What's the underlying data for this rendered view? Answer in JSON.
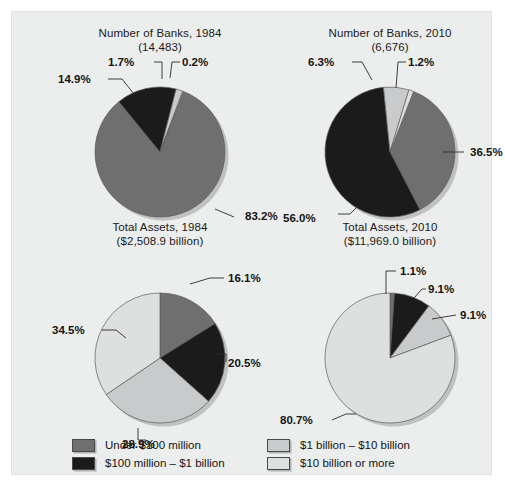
{
  "figure": {
    "background_color": "#eceded",
    "page_background": "#ffffff"
  },
  "palette": {
    "under_100m": "#6f6f6f",
    "100m_1b": "#1b1b1b",
    "1b_10b": "#c9cacb",
    "10b_or_more": "#dedfdf",
    "slice_outline": "#5d5d5d",
    "text": "#141414"
  },
  "legend": {
    "entries": [
      {
        "label": "Under $100 million",
        "color": "#6f6f6f"
      },
      {
        "label": "$100 million – $1 billion",
        "color": "#1b1b1b"
      },
      {
        "label": "$1 billion – $10 billion",
        "color": "#c9cacb"
      },
      {
        "label": "$10 billion or more",
        "color": "#dedfdf"
      }
    ]
  },
  "chart_data": [
    {
      "type": "pie",
      "id": "number-of-banks-1984",
      "title": "Number of Banks, 1984",
      "subtitle": "(14,483)",
      "categories": [
        "Under $100 million",
        "$100 million – $1 billion",
        "$1 billion – $10 billion",
        "$10 billion or more"
      ],
      "values": [
        83.2,
        14.9,
        1.7,
        0.2
      ],
      "labels": [
        "83.2%",
        "14.9%",
        "1.7%",
        "0.2%"
      ],
      "colors": [
        "#6f6f6f",
        "#1b1b1b",
        "#c9cacb",
        "#dedfdf"
      ],
      "units": "percent"
    },
    {
      "type": "pie",
      "id": "number-of-banks-2010",
      "title": "Number of Banks, 2010",
      "subtitle": "(6,676)",
      "categories": [
        "Under $100 million",
        "$100 million – $1 billion",
        "$1 billion – $10 billion",
        "$10 billion or more"
      ],
      "values": [
        36.5,
        56.0,
        6.3,
        1.2
      ],
      "labels": [
        "36.5%",
        "56.0%",
        "6.3%",
        "1.2%"
      ],
      "colors": [
        "#6f6f6f",
        "#1b1b1b",
        "#c9cacb",
        "#dedfdf"
      ],
      "units": "percent"
    },
    {
      "type": "pie",
      "id": "total-assets-1984",
      "title": "Total Assets, 1984",
      "subtitle": "($2,508.9 billion)",
      "categories": [
        "Under $100 million",
        "$100 million – $1 billion",
        "$1 billion – $10 billion",
        "$10 billion or more"
      ],
      "values": [
        16.1,
        20.5,
        28.9,
        34.5
      ],
      "labels": [
        "16.1%",
        "20.5%",
        "28.9%",
        "34.5%"
      ],
      "colors": [
        "#6f6f6f",
        "#1b1b1b",
        "#c9cacb",
        "#dedfdf"
      ],
      "units": "percent"
    },
    {
      "type": "pie",
      "id": "total-assets-2010",
      "title": "Total Assets, 2010",
      "subtitle": "($11,969.0 billion)",
      "categories": [
        "Under $100 million",
        "$100 million – $1 billion",
        "$1 billion – $10 billion",
        "$10 billion or more"
      ],
      "values": [
        1.1,
        9.1,
        9.1,
        80.7
      ],
      "labels": [
        "1.1%",
        "9.1%",
        "9.1%",
        "80.7%"
      ],
      "colors": [
        "#6f6f6f",
        "#1b1b1b",
        "#c9cacb",
        "#dedfdf"
      ],
      "units": "percent"
    }
  ],
  "layout": {
    "charts": [
      {
        "left": 38,
        "top": 14,
        "radius": 65,
        "cx": 110,
        "cy": 98,
        "start_angle": -1.2,
        "annotations": [
          {
            "label_key": 0,
            "tx": 195,
            "ty": 166,
            "anchor": "start",
            "path": "M 165 155 L 184 163"
          },
          {
            "label_key": 1,
            "tx": 8,
            "ty": 29,
            "anchor": "start",
            "path": "M 58 25 L 72 25 L 84 40"
          },
          {
            "label_key": 2,
            "tx": 58,
            "ty": 12,
            "anchor": "start",
            "path": "M 104 8 L 112 8 L 112 25"
          },
          {
            "label_key": 3,
            "tx": 132,
            "ty": 12,
            "anchor": "start",
            "path": "M 130 8 L 122 8 L 120 24"
          }
        ]
      },
      {
        "left": 268,
        "top": 14,
        "radius": 65,
        "cx": 110,
        "cy": 98,
        "start_angle": -1.2,
        "annotations": [
          {
            "label_key": 0,
            "tx": 190,
            "ty": 102,
            "anchor": "start",
            "path": "M 163 98 L 184 98"
          },
          {
            "label_key": 1,
            "tx": 3,
            "ty": 168,
            "anchor": "start",
            "path": "M 58 160 L 70 160 L 82 148"
          },
          {
            "label_key": 2,
            "tx": 28,
            "ty": 12,
            "anchor": "start",
            "path": "M 72 8 L 82 8 L 92 26"
          },
          {
            "label_key": 3,
            "tx": 128,
            "ty": 12,
            "anchor": "start",
            "path": "M 126 8 L 118 8 L 116 34"
          }
        ]
      },
      {
        "left": 38,
        "top": 208,
        "radius": 65,
        "cx": 110,
        "cy": 110,
        "start_angle": -1.5708,
        "annotations": [
          {
            "label_key": 0,
            "tx": 178,
            "ty": 34,
            "anchor": "start",
            "path": "M 140 36 L 160 30 L 174 30"
          },
          {
            "label_key": 1,
            "tx": 178,
            "ty": 119,
            "anchor": "start",
            "path": "M 166 106 L 176 106 L 176 114"
          },
          {
            "label_key": 2,
            "tx": 72,
            "ty": 200,
            "anchor": "start",
            "path": "M 88 180 L 88 192 L 96 192"
          },
          {
            "label_key": 3,
            "tx": 2,
            "ty": 86,
            "anchor": "start",
            "path": "M 52 82 L 66 82 L 76 90"
          }
        ]
      },
      {
        "left": 268,
        "top": 208,
        "radius": 65,
        "cx": 110,
        "cy": 110,
        "start_angle": -1.5708,
        "annotations": [
          {
            "label_key": 0,
            "tx": 120,
            "ty": 27,
            "anchor": "start",
            "path": "M 106 46 L 106 23 L 116 23"
          },
          {
            "label_key": 1,
            "tx": 148,
            "ty": 45,
            "anchor": "start",
            "path": "M 134 50 L 142 41 L 146 41"
          },
          {
            "label_key": 2,
            "tx": 180,
            "ty": 71,
            "anchor": "start",
            "path": "M 152 71 L 176 67"
          },
          {
            "label_key": 3,
            "tx": 0,
            "ty": 176,
            "anchor": "start",
            "path": "M 52 172 L 66 166 L 76 166"
          }
        ]
      }
    ]
  }
}
